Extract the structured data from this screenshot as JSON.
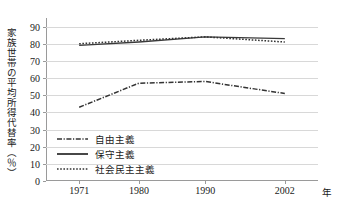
{
  "chart_data": {
    "type": "line",
    "title": "",
    "xlabel": "年",
    "ylabel": "家族世帯の平均所得代替率（％）",
    "x": [
      1971,
      1980,
      1990,
      2002
    ],
    "categories": [
      "1971",
      "1980",
      "1990",
      "2002"
    ],
    "xlim": [
      1966,
      2007
    ],
    "ylim": [
      0,
      95
    ],
    "ytick_values": [
      0,
      10,
      20,
      30,
      40,
      50,
      60,
      70,
      80,
      90
    ],
    "ytick_labels": [
      "0",
      "10",
      "20",
      "30",
      "40",
      "50",
      "60",
      "70",
      "80",
      "90"
    ],
    "grid": true,
    "legend_position": "lower-left-inside",
    "series": [
      {
        "name": "自由主義",
        "style": "dash-dot",
        "color": "#333333",
        "values": [
          43,
          57,
          58,
          51
        ]
      },
      {
        "name": "保守主義",
        "style": "solid",
        "color": "#3a3a3a",
        "values": [
          79,
          81,
          84,
          83
        ]
      },
      {
        "name": "社会民主主義",
        "style": "dotted",
        "color": "#333333",
        "values": [
          80,
          82,
          84,
          81
        ]
      }
    ]
  },
  "axis": {
    "y_title": "家族世帯の平均所得代替率（％）",
    "x_unit": "年"
  },
  "legend": {
    "items": [
      {
        "label": "自由主義",
        "style": "dash-dot"
      },
      {
        "label": "保守主義",
        "style": "solid"
      },
      {
        "label": "社会民主主義",
        "style": "dotted"
      }
    ]
  },
  "colors": {
    "axis": "#9a9a9a",
    "grid": "#d8d8d8",
    "text": "#1a1a1a",
    "line": "#333333",
    "background": "#ffffff"
  }
}
